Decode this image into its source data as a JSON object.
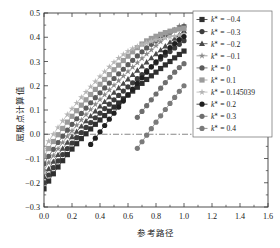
{
  "chart_data": {
    "type": "line",
    "title": "",
    "xlabel": "参考路径",
    "ylabel": "屈服点计算值",
    "xlim": [
      0.0,
      1.6
    ],
    "ylim": [
      -0.3,
      0.5
    ],
    "xticks": [
      "0.0",
      "0.2",
      "0.4",
      "0.6",
      "0.8",
      "1.0",
      "1.2",
      "1.4",
      "1.6"
    ],
    "yticks": [
      "-0.3",
      "-0.2",
      "-0.1",
      "0.0",
      "0.1",
      "0.2",
      "0.3",
      "0.4",
      "0.5"
    ],
    "grid": false,
    "zero_reference_line": 0.0,
    "legend_position": "upper right",
    "marker_size_px": 2.6,
    "series": [
      {
        "name": "k* = -0.4",
        "label": "k∗ = −0.4",
        "color": "#2f2f2f",
        "marker": "square",
        "x": [
          0.0,
          0.0333,
          0.0667,
          0.1,
          0.1333,
          0.1667,
          0.2,
          0.2333,
          0.2667,
          0.3,
          0.3333,
          0.3667,
          0.4,
          0.4333,
          0.4667,
          0.5,
          0.5333,
          0.5667,
          0.6,
          0.6333,
          0.6667,
          0.7,
          0.7333,
          0.7667,
          0.8,
          0.8333,
          0.8667,
          0.9,
          0.9333,
          0.9667,
          1.0
        ],
        "y": [
          -0.225,
          -0.193,
          -0.163,
          -0.135,
          -0.109,
          -0.084,
          -0.061,
          -0.039,
          -0.018,
          0.002,
          0.022,
          0.041,
          0.059,
          0.077,
          0.095,
          0.112,
          0.129,
          0.146,
          0.162,
          0.178,
          0.194,
          0.21,
          0.226,
          0.241,
          0.256,
          0.271,
          0.286,
          0.3,
          0.315,
          0.329,
          0.343
        ]
      },
      {
        "name": "k* = -0.3",
        "label": "k∗ = −0.3",
        "color": "#3d3d3d",
        "marker": "circle",
        "x": [
          0.0,
          0.0333,
          0.0667,
          0.1,
          0.1333,
          0.1667,
          0.2,
          0.2333,
          0.2667,
          0.3,
          0.3333,
          0.3667,
          0.4,
          0.4333,
          0.4667,
          0.5,
          0.5333,
          0.5667,
          0.6,
          0.6333,
          0.6667,
          0.7,
          0.7333,
          0.7667,
          0.8,
          0.8333,
          0.8667,
          0.9,
          0.9333,
          0.9667,
          1.0
        ],
        "y": [
          -0.2,
          -0.168,
          -0.138,
          -0.11,
          -0.084,
          -0.059,
          -0.036,
          -0.014,
          0.007,
          0.028,
          0.048,
          0.068,
          0.087,
          0.106,
          0.124,
          0.142,
          0.16,
          0.178,
          0.195,
          0.212,
          0.229,
          0.246,
          0.262,
          0.278,
          0.294,
          0.31,
          0.326,
          0.341,
          0.356,
          0.371,
          0.386
        ]
      },
      {
        "name": "k* = -0.2",
        "label": "k∗ = −0.2",
        "color": "#4a4a4a",
        "marker": "triangle",
        "x": [
          0.0,
          0.0333,
          0.0667,
          0.1,
          0.1333,
          0.1667,
          0.2,
          0.2333,
          0.2667,
          0.3,
          0.3333,
          0.3667,
          0.4,
          0.4333,
          0.4667,
          0.5,
          0.5333,
          0.5667,
          0.6,
          0.6333,
          0.6667,
          0.7,
          0.7333,
          0.7667,
          0.8,
          0.8333,
          0.8667,
          0.9,
          0.9333,
          0.9667,
          1.0
        ],
        "y": [
          -0.175,
          -0.143,
          -0.113,
          -0.085,
          -0.059,
          -0.034,
          -0.011,
          0.011,
          0.033,
          0.054,
          0.075,
          0.095,
          0.115,
          0.134,
          0.153,
          0.172,
          0.191,
          0.209,
          0.227,
          0.245,
          0.263,
          0.28,
          0.297,
          0.314,
          0.331,
          0.347,
          0.363,
          0.379,
          0.395,
          0.41,
          0.426
        ]
      },
      {
        "name": "k* = -0.1",
        "label": "k∗ = −0.1",
        "color": "#8a8a8a",
        "marker": "star",
        "x": [
          0.0,
          0.0333,
          0.0667,
          0.1,
          0.1333,
          0.1667,
          0.2,
          0.2333,
          0.2667,
          0.3,
          0.3333,
          0.3667,
          0.4,
          0.4333,
          0.4667,
          0.5,
          0.5333,
          0.5667,
          0.6,
          0.6333,
          0.6667,
          0.7,
          0.7333,
          0.7667,
          0.8,
          0.8333,
          0.8667,
          0.9,
          0.9333,
          0.9667,
          1.0
        ],
        "y": [
          -0.148,
          -0.117,
          -0.088,
          -0.06,
          -0.034,
          -0.009,
          0.014,
          0.037,
          0.059,
          0.081,
          0.102,
          0.123,
          0.143,
          0.163,
          0.183,
          0.202,
          0.221,
          0.24,
          0.259,
          0.277,
          0.295,
          0.313,
          0.331,
          0.348,
          0.365,
          0.382,
          0.398,
          0.414,
          0.43,
          0.446,
          0.448
        ]
      },
      {
        "name": "k* = 0",
        "label": "k∗ = 0",
        "color": "#5c5c5c",
        "marker": "circle",
        "x": [
          0.0,
          0.0333,
          0.0667,
          0.1,
          0.1333,
          0.1667,
          0.2,
          0.2333,
          0.2667,
          0.3,
          0.3333,
          0.3667,
          0.4,
          0.4333,
          0.4667,
          0.5,
          0.5333,
          0.5667,
          0.6,
          0.6333,
          0.6667,
          0.7,
          0.7333,
          0.7667,
          0.8,
          0.8333,
          0.8667,
          0.9,
          0.9333,
          0.9667,
          1.0
        ],
        "y": [
          -0.122,
          -0.091,
          -0.062,
          -0.034,
          -0.008,
          0.017,
          0.041,
          0.064,
          0.086,
          0.108,
          0.13,
          0.151,
          0.171,
          0.191,
          0.211,
          0.23,
          0.249,
          0.268,
          0.287,
          0.305,
          0.323,
          0.34,
          0.356,
          0.371,
          0.385,
          0.398,
          0.41,
          0.421,
          0.43,
          0.438,
          0.445
        ]
      },
      {
        "name": "k* = 0.1",
        "label": "k∗ = 0.1",
        "color": "#9b9b9b",
        "marker": "square",
        "x": [
          0.0,
          0.0333,
          0.0667,
          0.1,
          0.1333,
          0.1667,
          0.2,
          0.2333,
          0.2667,
          0.3,
          0.3333,
          0.3667,
          0.4,
          0.4333,
          0.4667,
          0.5,
          0.5333,
          0.5667,
          0.6,
          0.6333,
          0.6667,
          0.7,
          0.7333,
          0.7667,
          0.8,
          0.8333,
          0.8667,
          0.9,
          0.9333,
          0.9667,
          1.0
        ],
        "y": [
          -0.09,
          -0.059,
          -0.03,
          -0.002,
          0.024,
          0.05,
          0.074,
          0.097,
          0.12,
          0.142,
          0.164,
          0.185,
          0.206,
          0.226,
          0.246,
          0.266,
          0.285,
          0.304,
          0.322,
          0.34,
          0.357,
          0.372,
          0.385,
          0.395,
          0.404,
          0.412,
          0.419,
          0.425,
          0.43,
          0.434,
          0.437
        ]
      },
      {
        "name": "k* = 0.145039",
        "label": "k∗ = 0.145039",
        "color": "#b5b5b5",
        "marker": "star",
        "x": [
          0.0,
          0.0333,
          0.0667,
          0.1,
          0.1333,
          0.1667,
          0.2,
          0.2333,
          0.2667,
          0.3,
          0.3333,
          0.3667,
          0.4,
          0.4333,
          0.4667,
          0.5,
          0.5333,
          0.5667,
          0.6,
          0.6333,
          0.6667,
          0.7,
          0.7333,
          0.7667,
          0.8,
          0.8333,
          0.8667,
          0.9,
          0.9333,
          0.9667,
          1.0
        ],
        "y": [
          -0.06,
          -0.029,
          0.0,
          0.028,
          0.055,
          0.081,
          0.105,
          0.129,
          0.152,
          0.174,
          0.196,
          0.217,
          0.238,
          0.258,
          0.278,
          0.297,
          0.314,
          0.329,
          0.342,
          0.353,
          0.362,
          0.37,
          0.377,
          0.383,
          0.388,
          0.393,
          0.397,
          0.401,
          0.405,
          0.408,
          0.412
        ]
      },
      {
        "name": "k* = 0.2",
        "label": "k∗ = 0.2",
        "color": "#1f1f1f",
        "marker": "circle",
        "x": [
          0.3333,
          0.3667,
          0.4,
          0.4333,
          0.4667,
          0.5,
          0.5333,
          0.5667,
          0.6,
          0.6333,
          0.6667,
          0.7,
          0.7333,
          0.7667,
          0.8,
          0.8333,
          0.8667,
          0.9,
          0.9333,
          0.9667,
          1.0
        ],
        "y": [
          -0.042,
          -0.016,
          0.01,
          0.036,
          0.062,
          0.087,
          0.112,
          0.137,
          0.162,
          0.186,
          0.21,
          0.233,
          0.256,
          0.278,
          0.299,
          0.32,
          0.339,
          0.357,
          0.374,
          0.39,
          0.403
        ]
      },
      {
        "name": "k* = 0.3",
        "label": "k∗ = 0.3",
        "color": "#6e6e6e",
        "marker": "circle",
        "x": [
          0.6667,
          0.7,
          0.7333,
          0.7667,
          0.8,
          0.8333,
          0.8667,
          0.9,
          0.9333,
          0.9667,
          1.0
        ],
        "y": [
          0.07,
          0.094,
          0.118,
          0.142,
          0.166,
          0.19,
          0.213,
          0.235,
          0.256,
          0.275,
          0.291
        ]
      },
      {
        "name": "k* = 0.4",
        "label": "k∗ = 0.4",
        "color": "#7a7a7a",
        "marker": "circle",
        "x": [
          0.6667,
          0.7,
          0.7333,
          0.7667,
          0.8,
          0.8333,
          0.8667,
          0.9,
          0.9333,
          0.9667,
          1.0
        ],
        "y": [
          -0.058,
          -0.031,
          -0.004,
          0.023,
          0.05,
          0.076,
          0.102,
          0.127,
          0.152,
          0.177,
          0.2
        ]
      }
    ]
  },
  "legend": {
    "entries": [
      "k∗ = −0.4",
      "k∗ = −0.3",
      "k∗ = −0.2",
      "k∗ = −0.1",
      "k∗ = 0",
      "k∗ = 0.1",
      "k∗ = 0.145039",
      "k∗ = 0.2",
      "k∗ = 0.3",
      "k∗ = 0.4"
    ]
  },
  "axes": {
    "x_title": "参考路径",
    "y_title": "屈服点计算值"
  }
}
